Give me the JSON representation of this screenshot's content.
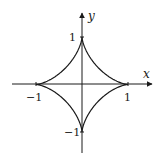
{
  "chart_data": {
    "type": "line",
    "title": "",
    "xlabel": "x",
    "ylabel": "y",
    "xlim": [
      -1.5,
      1.5
    ],
    "ylim": [
      -1.5,
      1.5
    ],
    "grid": false,
    "legend": null,
    "x_ticks": [
      -1,
      1
    ],
    "y_ticks": [
      -1,
      1
    ],
    "x_tick_labels": [
      "-1",
      "1"
    ],
    "y_tick_labels": [
      "-1",
      "1"
    ],
    "series": [
      {
        "name": "astroid",
        "equation": "x^(2/3) + y^(2/3) = 1",
        "parametric": "x = cos^3 t, y = sin^3 t",
        "cusps": [
          [
            1,
            0
          ],
          [
            0,
            1
          ],
          [
            -1,
            0
          ],
          [
            0,
            -1
          ]
        ],
        "color": "#1a1a1a"
      }
    ]
  },
  "axes": {
    "x_label": "x",
    "y_label": "y",
    "x_tick_neg": "−1",
    "x_tick_pos": "1",
    "y_tick_pos": "1",
    "y_tick_neg": "−1"
  }
}
